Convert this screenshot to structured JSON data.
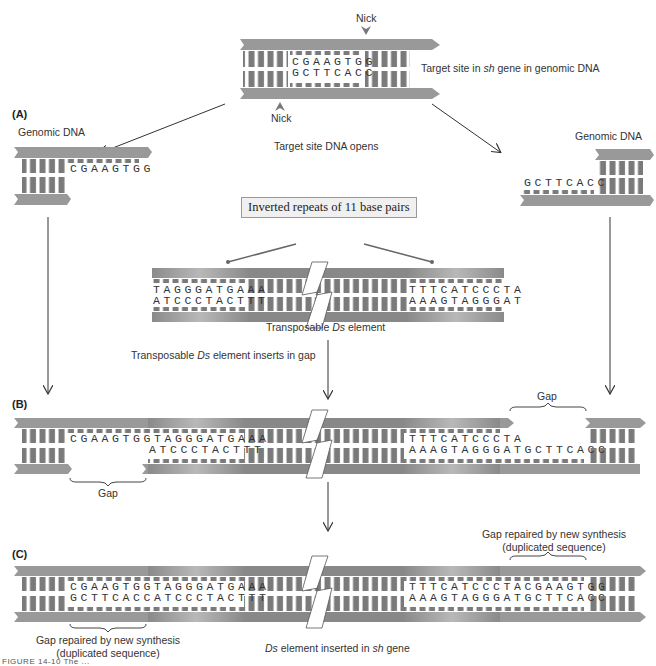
{
  "top": {
    "nick_top": "Nick",
    "nick_bottom": "Nick",
    "seq_top": "CGAAGTGG",
    "seq_bottom": "GCTTCACC",
    "label_pre": "Target site in ",
    "label_italic": "sh",
    "label_post": " gene in genomic DNA"
  },
  "panel_a": {
    "letter": "(A)",
    "left_label": "Genomic DNA",
    "left_seq": "CGAAGTGG",
    "right_label": "Genomic DNA",
    "right_seq": "GCTTCACC",
    "opens_label": "Target site DNA opens"
  },
  "ds_element": {
    "box_label": "Inverted repeats of 11 base pairs",
    "left_top": "TAGGGATGAAA",
    "left_bottom": "ATCCCTACTTT",
    "right_top": "TTTCATCCCTA",
    "right_bottom": "AAAGTAGGGAT",
    "label_pre": "Transposable ",
    "label_italic": "Ds",
    "label_post": " element",
    "inserts_pre": "Transposable ",
    "inserts_italic": "Ds",
    "inserts_post": " element inserts in gap"
  },
  "panel_b": {
    "letter": "(B)",
    "left_top": "CGAAGTGGTAGGGATGAAA",
    "left_bottom": "ATCCCTACTTT",
    "right_top": "TTTCATCCCTA",
    "right_bottom": "AAAGTAGGGATGCTTCACC",
    "gap_left": "Gap",
    "gap_right": "Gap"
  },
  "panel_c": {
    "letter": "(C)",
    "left_top": "CGAAGTGGTAGGGATGAAA",
    "left_bottom": "GCTTCACCATCCCTACTTT",
    "right_top": "TTTCATCCCTACGAAGTGG",
    "right_bottom": "AAAGTAGGGATGCTTCACC",
    "repair_left_1": "Gap repaired by new synthesis",
    "repair_left_2": "(duplicated sequence)",
    "repair_right_1": "Gap repaired by new synthesis",
    "repair_right_2": "(duplicated sequence)",
    "inserted_italic_1": "Ds",
    "inserted_mid": " element inserted in ",
    "inserted_italic_2": "sh",
    "inserted_post": " gene"
  },
  "caption": "FIGURE 14-10  The ..."
}
